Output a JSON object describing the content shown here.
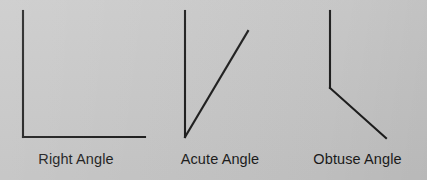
{
  "figure": {
    "background_color": "#c8c8c8",
    "line_color": "#1a1a1a",
    "text_color": "#1a1a1a"
  },
  "diagrams": [
    {
      "id": "right-angle",
      "label": "Right Angle",
      "angle_degrees": 90,
      "vertex": {
        "x": 23,
        "y": 137
      },
      "rays": [
        {
          "name": "vertical-ray",
          "x1": 23,
          "y1": 137,
          "x2": 23,
          "y2": 11
        },
        {
          "name": "horizontal-ray",
          "x1": 23,
          "y1": 137,
          "x2": 145,
          "y2": 137
        }
      ]
    },
    {
      "id": "acute-angle",
      "label": "Acute Angle",
      "angle_degrees": 26,
      "vertex": {
        "x": 185,
        "y": 137
      },
      "rays": [
        {
          "name": "vertical-ray",
          "x1": 185,
          "y1": 137,
          "x2": 185,
          "y2": 11
        },
        {
          "name": "diagonal-ray",
          "x1": 185,
          "y1": 137,
          "x2": 248,
          "y2": 31
        }
      ]
    },
    {
      "id": "obtuse-angle",
      "label": "Obtuse Angle",
      "angle_degrees": 138,
      "vertex": {
        "x": 330,
        "y": 88
      },
      "rays": [
        {
          "name": "vertical-ray",
          "x1": 330,
          "y1": 88,
          "x2": 330,
          "y2": 11
        },
        {
          "name": "diagonal-ray",
          "x1": 330,
          "y1": 88,
          "x2": 386,
          "y2": 138
        }
      ]
    }
  ]
}
